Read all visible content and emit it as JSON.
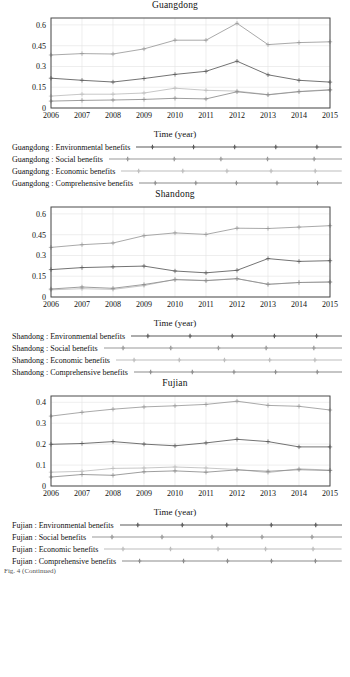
{
  "figure": {
    "x_axis_label": "Time (year)",
    "years": [
      2006,
      2007,
      2008,
      2009,
      2010,
      2011,
      2012,
      2013,
      2014,
      2015
    ],
    "series_names": [
      "Environmental benefits",
      "Social benefits",
      "Economic benefits",
      "Comprehensive benefits"
    ],
    "colors": {
      "environmental": "#5a5a5a",
      "social": "#9a9a9a",
      "economic": "#bdbdbd",
      "comprehensive": "#8c8c8c",
      "grid": "#e2e2e2",
      "frame": "#4a4a4a"
    },
    "caption_cut": "Fig. 4 (Continued)"
  },
  "chart_data": [
    {
      "type": "line",
      "title": "Guangdong",
      "xlabel": "Time (year)",
      "ylabel": "",
      "x": [
        2006,
        2007,
        2008,
        2009,
        2010,
        2011,
        2012,
        2013,
        2014,
        2015
      ],
      "xlim": [
        2006,
        2015
      ],
      "ylim": [
        0,
        0.65
      ],
      "yticks": [
        0,
        0.15,
        0.3,
        0.45,
        0.6
      ],
      "ytick_labels": [
        "0",
        "0.15",
        "0.3",
        "0.45",
        "0.6"
      ],
      "grid": true,
      "legend_position": "below",
      "series": [
        {
          "name": "Guangdong : Environmental benefits",
          "key": "environmental",
          "values": [
            0.215,
            0.2,
            0.188,
            0.213,
            0.243,
            0.265,
            0.338,
            0.24,
            0.2,
            0.187
          ]
        },
        {
          "name": "Guangdong : Social benefits",
          "key": "social",
          "values": [
            0.383,
            0.393,
            0.39,
            0.427,
            0.49,
            0.49,
            0.612,
            0.458,
            0.472,
            0.478
          ]
        },
        {
          "name": "Guangdong : Economic benefits",
          "key": "economic",
          "values": [
            0.086,
            0.1,
            0.1,
            0.108,
            0.143,
            0.128,
            0.122,
            0.097,
            0.12,
            0.133
          ]
        },
        {
          "name": "Guangdong : Comprehensive benefits",
          "key": "comprehensive",
          "values": [
            0.05,
            0.055,
            0.058,
            0.062,
            0.07,
            0.066,
            0.117,
            0.095,
            0.118,
            0.13
          ]
        }
      ]
    },
    {
      "type": "line",
      "title": "Shandong",
      "xlabel": "Time (year)",
      "ylabel": "",
      "x": [
        2006,
        2007,
        2008,
        2009,
        2010,
        2011,
        2012,
        2013,
        2014,
        2015
      ],
      "xlim": [
        2006,
        2015
      ],
      "ylim": [
        0,
        0.65
      ],
      "yticks": [
        0,
        0.15,
        0.3,
        0.45,
        0.6
      ],
      "ytick_labels": [
        "0",
        "0.15",
        "0.3",
        "0.45",
        "0.6"
      ],
      "grid": true,
      "legend_position": "below",
      "series": [
        {
          "name": "Shandong : Environmental benefits",
          "key": "environmental",
          "values": [
            0.198,
            0.212,
            0.218,
            0.223,
            0.188,
            0.175,
            0.193,
            0.277,
            0.257,
            0.262
          ]
        },
        {
          "name": "Shandong : Social benefits",
          "key": "social",
          "values": [
            0.358,
            0.378,
            0.39,
            0.443,
            0.463,
            0.452,
            0.497,
            0.495,
            0.505,
            0.515
          ]
        },
        {
          "name": "Shandong : Economic benefits",
          "key": "economic",
          "values": [
            0.052,
            0.06,
            0.055,
            0.082,
            0.128,
            0.12,
            0.133,
            0.092,
            0.105,
            0.108
          ]
        },
        {
          "name": "Shandong : Comprehensive benefits",
          "key": "comprehensive",
          "values": [
            0.058,
            0.072,
            0.063,
            0.09,
            0.125,
            0.118,
            0.132,
            0.092,
            0.105,
            0.108
          ]
        }
      ]
    },
    {
      "type": "line",
      "title": "Fujian",
      "xlabel": "Time (year)",
      "ylabel": "",
      "x": [
        2006,
        2007,
        2008,
        2009,
        2010,
        2011,
        2012,
        2013,
        2014,
        2015
      ],
      "xlim": [
        2006,
        2015
      ],
      "ylim": [
        0,
        0.43
      ],
      "yticks": [
        0,
        0.1,
        0.2,
        0.3,
        0.4
      ],
      "ytick_labels": [
        "0",
        "0.1",
        "0.2",
        "0.3",
        "0.4"
      ],
      "grid": true,
      "legend_position": "below",
      "series": [
        {
          "name": "Fujian : Environmental benefits",
          "key": "environmental",
          "values": [
            0.199,
            0.203,
            0.212,
            0.2,
            0.192,
            0.206,
            0.223,
            0.212,
            0.187,
            0.187
          ]
        },
        {
          "name": "Fujian : Social benefits",
          "key": "social",
          "values": [
            0.334,
            0.352,
            0.367,
            0.378,
            0.383,
            0.39,
            0.405,
            0.385,
            0.381,
            0.363
          ]
        },
        {
          "name": "Fujian : Economic benefits",
          "key": "economic",
          "values": [
            0.066,
            0.07,
            0.084,
            0.086,
            0.091,
            0.086,
            0.079,
            0.064,
            0.082,
            0.076
          ]
        },
        {
          "name": "Fujian : Comprehensive benefits",
          "key": "comprehensive",
          "values": [
            0.043,
            0.055,
            0.051,
            0.068,
            0.072,
            0.066,
            0.077,
            0.07,
            0.078,
            0.074
          ]
        }
      ]
    }
  ],
  "panels": [
    {
      "title": "Guangdong",
      "legend": [
        {
          "label": "Guangdong : Environmental benefits",
          "key": "environmental"
        },
        {
          "label": "Guangdong : Social benefits",
          "key": "social"
        },
        {
          "label": "Guangdong : Economic benefits",
          "key": "economic"
        },
        {
          "label": "Guangdong : Comprehensive benefits",
          "key": "comprehensive"
        }
      ]
    },
    {
      "title": "Shandong",
      "legend": [
        {
          "label": "Shandong : Environmental benefits",
          "key": "environmental"
        },
        {
          "label": "Shandong : Social benefits",
          "key": "social"
        },
        {
          "label": "Shandong : Economic benefits",
          "key": "economic"
        },
        {
          "label": "Shandong : Comprehensive benefits",
          "key": "comprehensive"
        }
      ]
    },
    {
      "title": "Fujian",
      "legend": [
        {
          "label": "Fujian : Environmental benefits",
          "key": "environmental"
        },
        {
          "label": "Fujian : Social benefits",
          "key": "social"
        },
        {
          "label": "Fujian : Economic benefits",
          "key": "economic"
        },
        {
          "label": "Fujian : Comprehensive benefits",
          "key": "comprehensive"
        }
      ]
    }
  ]
}
